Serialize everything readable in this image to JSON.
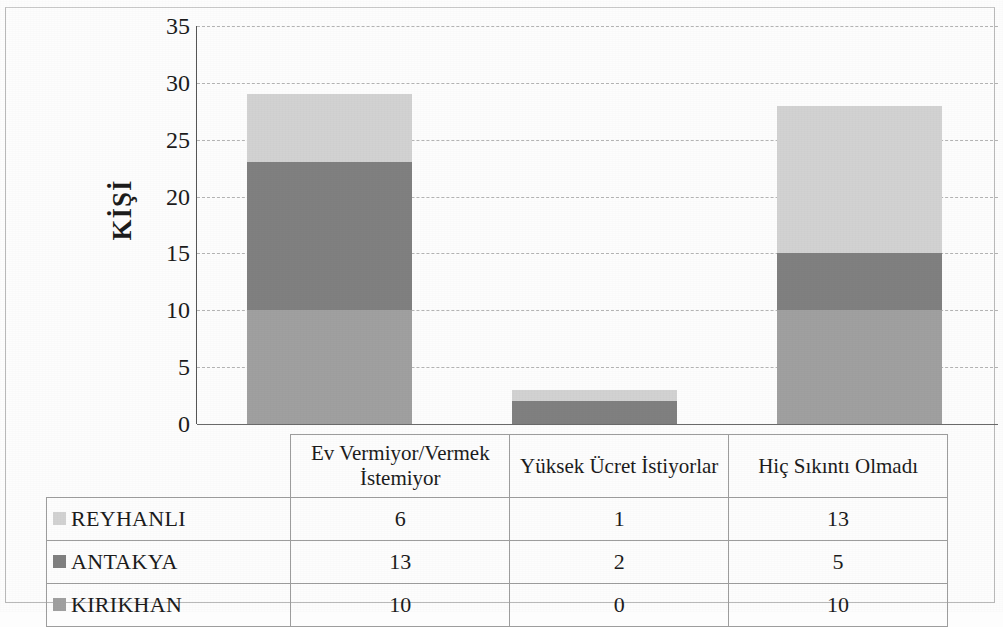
{
  "chart_data": {
    "type": "bar",
    "stacked": true,
    "title": "",
    "subtitle": "",
    "xlabel": "",
    "ylabel": "KİŞİ",
    "ylim": [
      0,
      35
    ],
    "ytick_step": 5,
    "yticks": [
      "35",
      "30",
      "25",
      "20",
      "15",
      "10",
      "5",
      "0"
    ],
    "grid": true,
    "legend_position": "data-table",
    "categories": [
      "Ev Vermiyor/Vermek İstemiyor",
      "Yüksek Ücret İstiyorlar",
      "Hiç Sıkıntı Olmadı"
    ],
    "series": [
      {
        "name": "REYHANLI",
        "values": [
          6,
          1,
          13
        ],
        "color": "#d2d2d2",
        "stack_order": 3
      },
      {
        "name": "ANTAKYA",
        "values": [
          13,
          2,
          5
        ],
        "color": "#808080",
        "stack_order": 2
      },
      {
        "name": "KIRIKHAN",
        "values": [
          10,
          0,
          10
        ],
        "color": "#a0a0a0",
        "stack_order": 1
      }
    ],
    "totals": [
      29,
      3,
      28
    ]
  },
  "data_table": {
    "header_row": [
      "",
      "Ev Vermiyor/Vermek İstemiyor",
      "Yüksek Ücret İstiyorlar",
      "Hiç Sıkıntı Olmadı"
    ],
    "rows": [
      {
        "label": "REYHANLI",
        "color": "#d2d2d2",
        "cells": [
          "6",
          "1",
          "13"
        ]
      },
      {
        "label": "ANTAKYA",
        "color": "#808080",
        "cells": [
          "13",
          "2",
          "5"
        ]
      },
      {
        "label": "KIRIKHAN",
        "color": "#a0a0a0",
        "cells": [
          "10",
          "0",
          "10"
        ]
      }
    ]
  },
  "axis": {
    "y_label": "KİŞİ",
    "y_ticks": [
      "35",
      "30",
      "25",
      "20",
      "15",
      "10",
      "5",
      "0"
    ]
  },
  "colors": {
    "reyhanli": "#d2d2d2",
    "antakya": "#808080",
    "kirikhan": "#a0a0a0",
    "gridline": "#b4b4b4",
    "axis": "#555555",
    "table_border": "#9d9d9d"
  }
}
